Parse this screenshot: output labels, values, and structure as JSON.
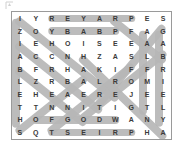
{
  "page": {
    "background_color": "#ffffff"
  },
  "corner_mark": {
    "name": "page-corner-mark",
    "label": ""
  },
  "puzzle": {
    "border_color": "#9a9a9a",
    "background_color": "#ffffff",
    "highlight_color": "#b6b6b6",
    "letter_color": "#3a3a3a",
    "rows": 10,
    "columns": 10,
    "grid": [
      [
        "I",
        "Y",
        "R",
        "E",
        "Y",
        "A",
        "R",
        "P",
        "E",
        "S"
      ],
      [
        "Z",
        "O",
        "Y",
        "B",
        "A",
        "B",
        "P",
        "F",
        "A",
        "G"
      ],
      [
        "I",
        "E",
        "H",
        "O",
        "I",
        "S",
        "E",
        "E",
        "A",
        "A"
      ],
      [
        "A",
        "C",
        "C",
        "N",
        "H",
        "Z",
        "A",
        "S",
        "L",
        "B"
      ],
      [
        "B",
        "F",
        "R",
        "H",
        "A",
        "K",
        "I",
        "F",
        "F",
        "R"
      ],
      [
        "L",
        "Z",
        "R",
        "B",
        "A",
        "L",
        "R",
        "O",
        "M",
        "I"
      ],
      [
        "E",
        "H",
        "E",
        "A",
        "E",
        "R",
        "E",
        "J",
        "E",
        "E"
      ],
      [
        "T",
        "T",
        "N",
        "N",
        "I",
        "T",
        "I",
        "G",
        "T",
        "L"
      ],
      [
        "H",
        "O",
        "F",
        "G",
        "O",
        "D",
        "W",
        "A",
        "N",
        "Y"
      ],
      [
        "S",
        "Q",
        "T",
        "S",
        "E",
        "I",
        "R",
        "P",
        "H",
        "A"
      ]
    ],
    "found_words": [
      {
        "word": "PRAYER",
        "direction": "horizontal-reversed",
        "row": 1,
        "start_col": 3,
        "end_col": 8
      },
      {
        "word": "BABY",
        "direction": "horizontal-reversed",
        "row": 2,
        "start_col": 3,
        "end_col": 7
      },
      {
        "word": "GABRIEL",
        "direction": "vertical-down",
        "col": 10,
        "start_row": 2,
        "end_row": 9
      },
      {
        "word": "ELIZABETH",
        "direction": "vertical-up",
        "col": 1,
        "start_row": 1,
        "end_row": 9
      },
      {
        "word": "OF GOD",
        "direction": "horizontal",
        "row": 9,
        "start_col": 2,
        "end_col": 7
      },
      {
        "word": "PRIEST",
        "direction": "horizontal-reversed",
        "row": 10,
        "start_col": 3,
        "end_col": 8
      },
      {
        "word": "ZECHARIAH",
        "direction": "diagonal-down-right",
        "start_row": 2,
        "start_col": 1
      },
      {
        "word": "ANGEL",
        "direction": "diagonal-down-left",
        "start_row": 3,
        "start_col": 9
      },
      {
        "word": "JOHN",
        "direction": "diagonal-up-right",
        "start_row": 9,
        "start_col": 2
      },
      {
        "word": "SON",
        "direction": "diagonal-down-right",
        "start_row": 5,
        "start_col": 2
      }
    ]
  }
}
